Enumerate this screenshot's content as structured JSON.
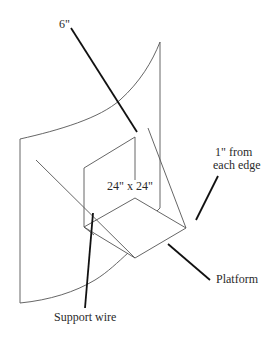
{
  "diagram": {
    "labels": {
      "depth": "6\"",
      "size": "24\" x 24\"",
      "edge_line1": "1\" from",
      "edge_line2": "each edge",
      "platform": "Platform",
      "support_wire": "Support wire"
    },
    "colors": {
      "line": "#555555",
      "leader": "#111111",
      "text": "#2a2a2a",
      "background": "#ffffff"
    }
  }
}
